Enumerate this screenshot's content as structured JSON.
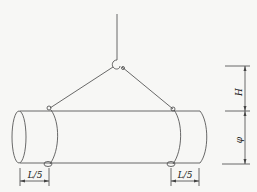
{
  "diagram": {
    "labels": {
      "height": "H",
      "diameter": "φ",
      "left_offset": "L/5",
      "right_offset": "L/5"
    },
    "colors": {
      "line": "#444444",
      "background": "#f7f7f5"
    }
  }
}
